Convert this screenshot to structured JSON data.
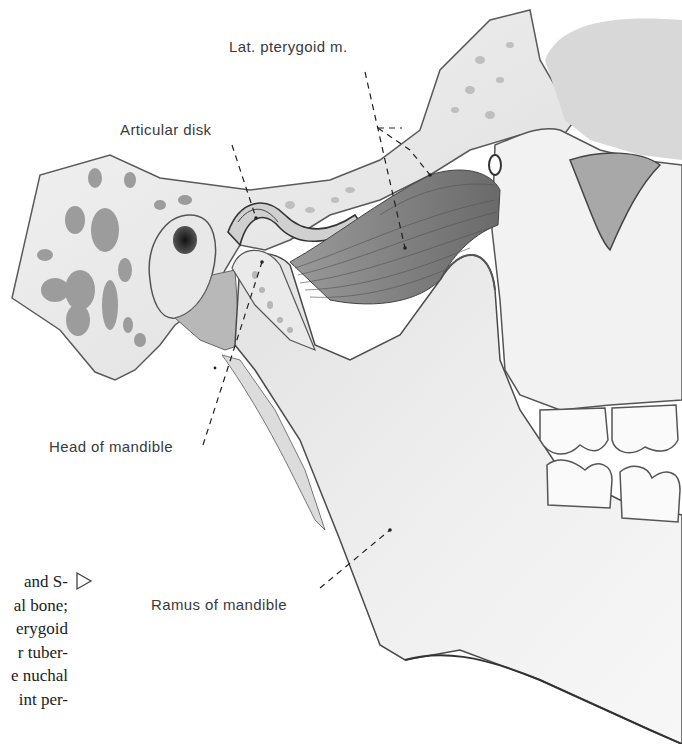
{
  "figure": {
    "labels": {
      "lat_pterygoid": "Lat. pterygoid m.",
      "articular_disk": "Articular disk",
      "head_of_mandible": "Head of mandible",
      "ramus_of_mandible": "Ramus of mandible"
    },
    "colors": {
      "background": "#ffffff",
      "label_text": "#3a3a3a",
      "bone_fill": "#eeeeee",
      "bone_dark": "#9a9a9a",
      "muscle": "#7d7d7d",
      "outline": "#4a4a4a"
    }
  },
  "caption_fragment": {
    "lines": [
      "and S-",
      "al bone;",
      "erygoid",
      "r tuber-",
      "e nuchal",
      "int per-"
    ],
    "arrow_icon": "▷"
  }
}
